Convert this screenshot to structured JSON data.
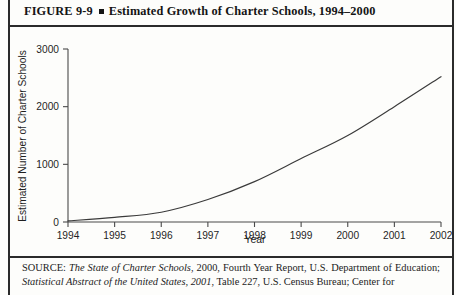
{
  "figure": {
    "label": "FIGURE  9-9",
    "marker": "square-bullet",
    "title": "Estimated Growth of Charter Schools, 1994–2000"
  },
  "source": {
    "prefix": "SOURCE:",
    "italic_1": "The State of Charter Schools",
    "text_1": ", 2000, Fourth Year Report, U.S. Department of Education; ",
    "italic_2": "Statistical Abstract of the United States, 2001",
    "text_2": ", Table 227, U.S. Census Bureau; Center for",
    "full": "SOURCE: The State of Charter Schools, 2000, Fourth Year Report, U.S. Department of Education; Statistical Abstract of the United States, 2001, Table 227, U.S. Census Bureau; Center for"
  },
  "chart_data": {
    "type": "line",
    "title": "Estimated Growth of Charter Schools, 1994–2000",
    "xlabel": "Year",
    "ylabel": "Estimated Number of Charter Schools",
    "categories": [
      "1994",
      "1995",
      "1996",
      "1997",
      "1998",
      "1999",
      "2000",
      "2001",
      "2002"
    ],
    "x": [
      1994,
      1995,
      1996,
      1997,
      1998,
      1999,
      2000,
      2001,
      2002
    ],
    "values": [
      20,
      80,
      170,
      390,
      700,
      1100,
      1500,
      2000,
      2520
    ],
    "series": [
      {
        "name": "Estimated Number of Charter Schools",
        "values": [
          20,
          80,
          170,
          390,
          700,
          1100,
          1500,
          2000,
          2520
        ]
      }
    ],
    "xlim": [
      1994,
      2002
    ],
    "ylim": [
      0,
      3000
    ],
    "yticks": [
      0,
      1000,
      2000,
      3000
    ],
    "ytick_labels": [
      "0",
      "1000",
      "2000",
      "3000"
    ],
    "xtick_labels": [
      "1994",
      "1995",
      "1996",
      "1997",
      "1998",
      "1999",
      "2000",
      "2001",
      "2002"
    ],
    "grid": false,
    "legend": "none",
    "line_color": "#3a3a3a",
    "axis_color": "#4a4a4a"
  }
}
